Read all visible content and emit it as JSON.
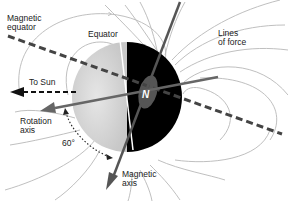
{
  "labels": {
    "magnetic_equator": [
      "Magnetic",
      "equator"
    ],
    "equator": "Equator",
    "lines_of_force": [
      "Lines",
      "of force"
    ],
    "to_sun": "To Sun",
    "rotation_axis": [
      "Rotation",
      "axis"
    ],
    "angle": "60°",
    "magnetic_axis": [
      "Magnetic",
      "axis"
    ],
    "pole": "N"
  },
  "colors": {
    "night_side": "#000000",
    "day_side": "#d8d8d8",
    "field_lines": "#b4b4b4",
    "axes": "#555555",
    "magnetic_equator_line": "#444444",
    "pole_blob": "#555555"
  }
}
